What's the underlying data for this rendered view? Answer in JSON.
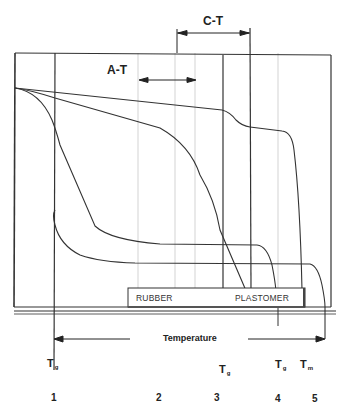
{
  "diagram": {
    "title": "",
    "x_axis_label": "Temperature",
    "ranges": {
      "at_label": "A-T",
      "ct_label": "C-T"
    },
    "box_labels": {
      "rubber": "RUBBER",
      "plastomer": "PLASTOMER"
    },
    "transition_labels": [
      {
        "main": "T",
        "sub": "g"
      },
      {
        "main": "T",
        "sub": "g"
      },
      {
        "main": "T",
        "sub": "g"
      },
      {
        "main": "T",
        "sub": "m"
      }
    ],
    "curve_numbers": [
      "1",
      "2",
      "3",
      "4",
      "5"
    ],
    "colors": {
      "line": "#333333",
      "dotted": "#bbbbbb",
      "background": "#ffffff"
    }
  }
}
